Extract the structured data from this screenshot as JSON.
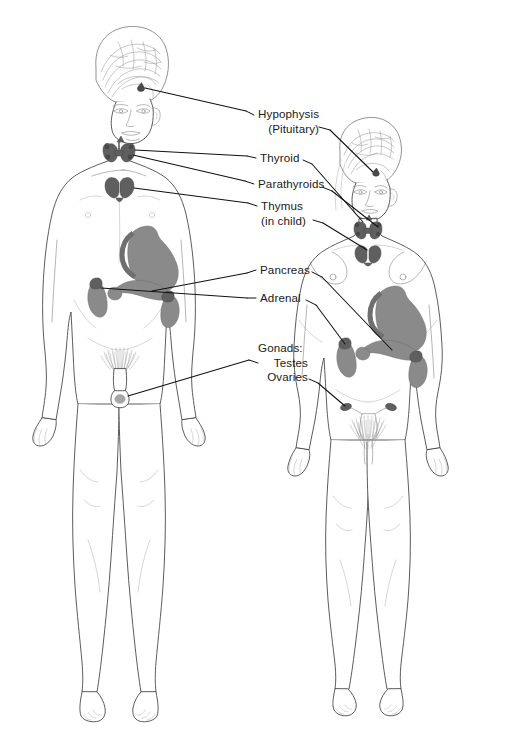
{
  "diagram": {
    "background_color": "#ffffff",
    "line_color": "#4a4a4a",
    "organ_fill_color": "#8a8a8a",
    "organ_dark_color": "#5f5f5f",
    "leader_color": "#111111"
  },
  "figures": [
    {
      "id": "male-figure",
      "sex": "male",
      "position": "left",
      "features": [
        "sagittal brain cutaway",
        "thyroid",
        "thymus",
        "stomach",
        "pancreas",
        "adrenal glands",
        "testes"
      ]
    },
    {
      "id": "female-figure",
      "sex": "female",
      "position": "right",
      "features": [
        "sagittal brain cutaway",
        "thyroid",
        "thymus",
        "stomach",
        "pancreas",
        "adrenal glands",
        "uterus",
        "ovaries"
      ]
    }
  ],
  "labels": [
    {
      "id": "hypophysis",
      "lines": [
        "Hypophysis",
        "(Pituitary)"
      ],
      "line1": "Hypophysis",
      "line2": "(Pituitary)",
      "organ": "pituitary-gland"
    },
    {
      "id": "thyroid",
      "lines": [
        "Thyroid"
      ],
      "line1": "Thyroid",
      "organ": "thyroid-gland"
    },
    {
      "id": "parathyroids",
      "lines": [
        "Parathyroids"
      ],
      "line1": "Parathyroids",
      "organ": "parathyroid-glands"
    },
    {
      "id": "thymus",
      "lines": [
        "Thymus",
        "(in child)"
      ],
      "line1": "Thymus",
      "line2": "(in child)",
      "organ": "thymus-gland"
    },
    {
      "id": "pancreas",
      "lines": [
        "Pancreas"
      ],
      "line1": "Pancreas",
      "organ": "pancreas-gland"
    },
    {
      "id": "adrenal",
      "lines": [
        "Adrenal"
      ],
      "line1": "Adrenal",
      "organ": "adrenal-glands"
    },
    {
      "id": "gonads",
      "lines": [
        "Gonads:",
        "Testes",
        "Ovaries"
      ],
      "line1": "Gonads:",
      "line2": "Testes",
      "line3": "Ovaries",
      "organ": "gonads"
    }
  ]
}
